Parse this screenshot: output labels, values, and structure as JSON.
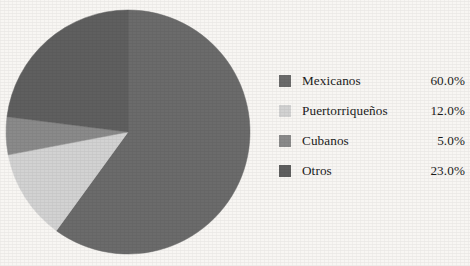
{
  "background_color": "#f8f6f3",
  "chart_data": {
    "type": "pie",
    "title": "",
    "labels": [
      "Mexicanos",
      "Puertorriqueños",
      "Cubanos",
      "Otros"
    ],
    "values": [
      60.0,
      12.0,
      5.0,
      23.0
    ],
    "value_labels": [
      "60.0%",
      "12.0%",
      "5.0%",
      "23.0%"
    ],
    "colors": [
      "#6b6b6b",
      "#d2d2d2",
      "#8a8a8a",
      "#5f5f5f"
    ],
    "start_angle_deg": 0,
    "direction": "clockwise",
    "legend_position": "right",
    "grid": false
  },
  "legend": {
    "rows": [
      {
        "label": "Mexicanos",
        "value": "60.0%",
        "color": "#6b6b6b"
      },
      {
        "label": "Puertorriqueños",
        "value": "12.0%",
        "color": "#d2d2d2"
      },
      {
        "label": "Cubanos",
        "value": "5.0%",
        "color": "#8a8a8a"
      },
      {
        "label": "Otros",
        "value": "23.0%",
        "color": "#5f5f5f"
      }
    ]
  }
}
